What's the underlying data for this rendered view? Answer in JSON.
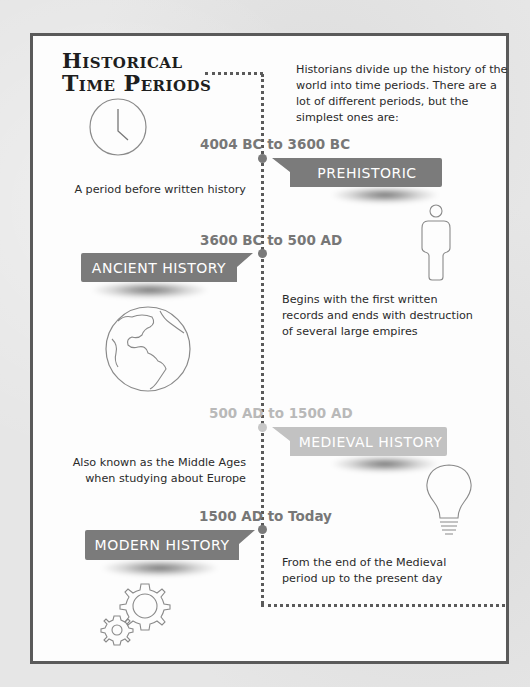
{
  "title": {
    "line1": "Historical",
    "line2": "Time Periods"
  },
  "intro": "Historians divide up the history of the world into time periods. There are a lot of different periods, but the simplest ones are:",
  "colors": {
    "banner_dark": "#7b7b7b",
    "banner_light": "#c2c2c2",
    "date_dark": "#777777",
    "date_light": "#b9b9b9",
    "frame_border": "#5a5a5a",
    "icon_stroke": "#8a8a8a"
  },
  "periods": [
    {
      "range": "4004 BC to 3600 BC",
      "name": "PREHISTORIC",
      "description": "A period before written history",
      "icon": "person-icon"
    },
    {
      "range": "3600 BC to 500 AD",
      "name": "ANCIENT HISTORY",
      "description": "Begins with the first written records and ends with destruction of several large empires",
      "icon": "globe-icon"
    },
    {
      "range": "500 AD to 1500 AD",
      "name": "MEDIEVAL HISTORY",
      "description_line1": "Also known as the Middle Ages",
      "description_line2": "when studying about Europe",
      "icon": "lightbulb-icon"
    },
    {
      "range": "1500 AD to Today",
      "name": "MODERN HISTORY",
      "description": "From the end of the Medieval period up to the present day",
      "icon": "gears-icon"
    }
  ],
  "header_icon": "clock-icon"
}
